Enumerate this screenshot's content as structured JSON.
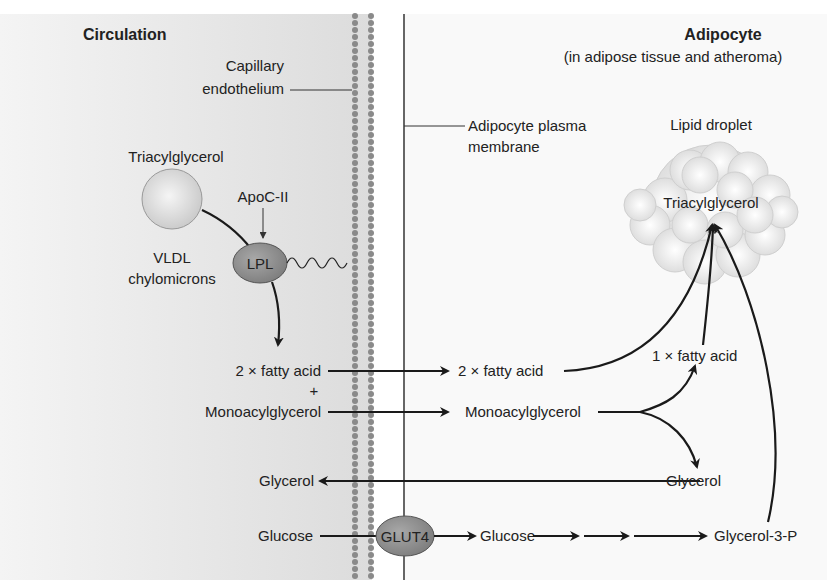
{
  "diagram": {
    "title_left": "Circulation",
    "title_right": "Adipocyte",
    "subtitle_right": "(in adipose tissue and atheroma)",
    "colors": {
      "circulation_bg": "#e6e6e6",
      "membrane_dots": "#8a8a8a",
      "lpl_fill": "#8c8c8c",
      "glut4_fill": "#8c8c8c",
      "droplet_fill": "#efefef"
    },
    "labels": {
      "capillary_line1": "Capillary",
      "capillary_line2": "endothelium",
      "plasma_membrane_line1": "Adipocyte plasma",
      "plasma_membrane_line2": "membrane",
      "lipid_droplet": "Lipid droplet",
      "droplet_tag": "Triacylglycerol",
      "vldl_tag": "Triacylglycerol",
      "vldl_line1": "VLDL",
      "vldl_line2": "chylomicrons",
      "apoc": "ApoC-II",
      "lpl": "LPL",
      "glut4": "GLUT4"
    },
    "left_metabolites": {
      "fatty_acid": "2 × fatty acid",
      "plus": "+",
      "mag": "Monoacylglycerol",
      "glycerol": "Glycerol",
      "glucose": "Glucose"
    },
    "right_metabolites": {
      "fatty_acid": "2 × fatty acid",
      "mag": "Monoacylglycerol",
      "one_fatty_acid": "1 × fatty acid",
      "glycerol": "Glycerol",
      "glucose": "Glucose",
      "g3p": "Glycerol-3-P"
    }
  }
}
